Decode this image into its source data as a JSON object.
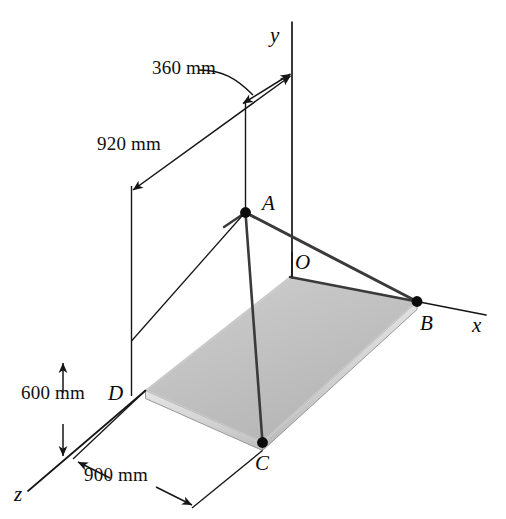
{
  "figure": {
    "background_color": "#ffffff",
    "line_color": "#161616",
    "plate_top_color": "#c0c0c0",
    "plate_edge_color": "#d4d4d4",
    "width": 506,
    "height": 519
  },
  "dimensions": [
    {
      "id": "d360",
      "label": "360 mm",
      "value": 360,
      "unit": "mm",
      "axis": "x"
    },
    {
      "id": "d920",
      "label": "920 mm",
      "value": 920,
      "unit": "mm",
      "axis": "z"
    },
    {
      "id": "d600",
      "label": "600 mm",
      "value": 600,
      "unit": "mm",
      "axis": "y"
    },
    {
      "id": "d900",
      "label": "900 mm",
      "value": 900,
      "unit": "mm",
      "axis": "z"
    }
  ],
  "points": [
    {
      "id": "A",
      "label": "A",
      "marker": "dot"
    },
    {
      "id": "B",
      "label": "B",
      "marker": "dot"
    },
    {
      "id": "C",
      "label": "C",
      "marker": "dot"
    },
    {
      "id": "D",
      "label": "D",
      "marker": "none"
    },
    {
      "id": "O",
      "label": "O",
      "marker": "none"
    }
  ],
  "axes": [
    {
      "id": "x",
      "label": "x"
    },
    {
      "id": "y",
      "label": "y"
    },
    {
      "id": "z",
      "label": "z"
    }
  ]
}
